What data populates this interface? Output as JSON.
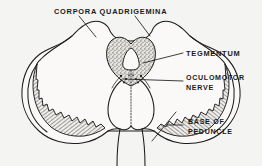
{
  "figure": {
    "background_color": "#f4f4f2",
    "ink_color": "#1c1c1c"
  },
  "labels": {
    "corpora_quadrigemina": "CORPORA QUADRIGEMINA",
    "tegmentum": "TEGMENTUM",
    "oculomotor_nerve_line1": "OCULOMOTOR",
    "oculomotor_nerve_line2": "NERVE",
    "base_of_peduncle_line1": "BASE OF",
    "base_of_peduncle_line2": "PEDUNCLE"
  },
  "structures": [
    {
      "name": "corpora-quadrigemina",
      "description": "paired rounded colliculi forming the dorsal roof"
    },
    {
      "name": "tegmentum",
      "description": "stippled heart-shaped central region with cerebral aqueduct"
    },
    {
      "name": "cerebral-aqueduct",
      "description": "triangular opening within the tegmentum"
    },
    {
      "name": "oculomotor-nerve",
      "description": "paired nerve roots emerging at the base of the tegmentum"
    },
    {
      "name": "base-of-peduncle",
      "description": "hatched crescent bands with serrated inner margin"
    },
    {
      "name": "interpeduncular-region",
      "description": "central lobed structure below the tegmentum"
    }
  ]
}
